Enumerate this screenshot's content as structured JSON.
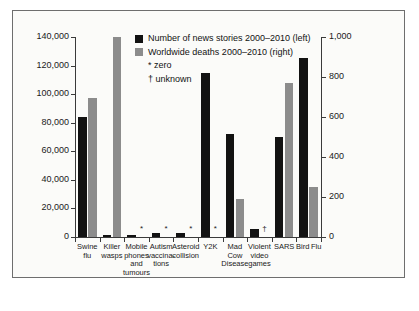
{
  "chart_data": {
    "type": "bar",
    "title": "",
    "subtitle": "",
    "xlabel": "",
    "ylabel": "",
    "categories": [
      "Swine flu",
      "Killer wasps",
      "Mobile phones and tumours",
      "Autism vaccinations",
      "Asteroid collision",
      "Y2K",
      "Mad Cow Disease",
      "Violent video games",
      "SARS",
      "Bird Flu"
    ],
    "category_lines": [
      [
        "Swine",
        "flu"
      ],
      [
        "Killer",
        "wasps"
      ],
      [
        "Mobile",
        "phones",
        "and",
        "tumours"
      ],
      [
        "Autism",
        "vaccina-",
        "tions"
      ],
      [
        "Asteroid",
        "collision"
      ],
      [
        "Y2K"
      ],
      [
        "Mad",
        "Cow",
        "Disease"
      ],
      [
        "Violent",
        "video",
        "games"
      ],
      [
        "SARS"
      ],
      [
        "Bird Flu"
      ]
    ],
    "series": [
      {
        "name": "Number of news stories 2000–2010 (left)",
        "axis": "left",
        "color": "#121212",
        "values": [
          84000,
          1500,
          1400,
          2600,
          2800,
          115000,
          72000,
          5500,
          70000,
          125000
        ]
      },
      {
        "name": "Worldwide deaths 2000–2010 (right)",
        "axis": "right",
        "color": "#8c8c8c",
        "values": [
          695,
          1000,
          0,
          0,
          0,
          0,
          190,
          null,
          770,
          250
        ]
      }
    ],
    "left_axis": {
      "min": 0,
      "max": 140000,
      "ticks": [
        0,
        20000,
        40000,
        60000,
        80000,
        100000,
        120000,
        140000
      ],
      "tick_labels": [
        "0",
        "20,000",
        "40,000",
        "60,000",
        "80,000",
        "100,000",
        "120,000",
        "140,000"
      ]
    },
    "right_axis": {
      "min": 0,
      "max": 1000,
      "ticks": [
        0,
        200,
        400,
        600,
        800,
        1000
      ],
      "tick_labels": [
        "0",
        "200",
        "400",
        "600",
        "800",
        "1,000"
      ]
    },
    "markers": {
      "zero": "*",
      "unknown": "†"
    },
    "deaths_markers": [
      null,
      null,
      "*",
      "*",
      "*",
      "*",
      null,
      "†",
      null,
      null
    ],
    "grid": false,
    "legend_position": "inside-top-center"
  },
  "legend": {
    "entries": [
      {
        "label": "Number of news stories 2000–2010 (left)",
        "swatch": "news"
      },
      {
        "label": "Worldwide deaths 2000–2010 (right)",
        "swatch": "deaths"
      }
    ],
    "notes": [
      "* zero",
      "† unknown"
    ]
  }
}
